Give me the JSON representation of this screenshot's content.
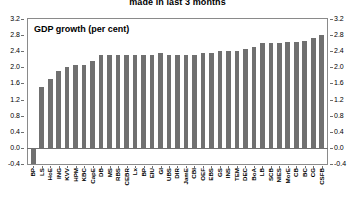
{
  "chart_data": {
    "type": "bar",
    "title": "made in last 3 months",
    "subtitle": "GDP growth (per cent)",
    "xlabel": "",
    "ylabel": "",
    "ylim": [
      -0.4,
      3.2
    ],
    "ytick_labels": [
      "3.2",
      "2.8",
      "2.4",
      "2.0",
      "1.6",
      "1.2",
      "0.8",
      "0.4",
      "0.0",
      "-0.4"
    ],
    "ytick_values": [
      3.2,
      2.8,
      2.4,
      2.0,
      1.6,
      1.2,
      0.8,
      0.4,
      0.0,
      -0.4
    ],
    "grid": false,
    "legend": "none",
    "right_axis": true,
    "bar_color": "#707070",
    "categories": [
      "BP",
      "LS",
      "HoE",
      "ING",
      "KVV",
      "HPM",
      "KBC",
      "CapE",
      "DB",
      "MS",
      "RBS",
      "CEBR",
      "Lx",
      "BP",
      "EIU",
      "GI",
      "UBS",
      "DIR",
      "JamE",
      "CBI",
      "OEF",
      "EBS",
      "GS",
      "INS",
      "TEM",
      "DEC",
      "BoA",
      "LB",
      "SCB",
      "NIES",
      "MorE",
      "CB",
      "BC",
      "CG",
      "CSFB"
    ],
    "values": [
      -0.4,
      1.5,
      1.7,
      1.9,
      2.0,
      2.05,
      2.05,
      2.15,
      2.3,
      2.3,
      2.3,
      2.3,
      2.3,
      2.3,
      2.3,
      2.35,
      2.3,
      2.3,
      2.3,
      2.3,
      2.35,
      2.35,
      2.4,
      2.4,
      2.4,
      2.45,
      2.5,
      2.6,
      2.6,
      2.6,
      2.62,
      2.62,
      2.65,
      2.72,
      2.8
    ]
  },
  "colors": {
    "bar": "#707070",
    "axis": "#8a8a8a",
    "text": "#000000"
  }
}
